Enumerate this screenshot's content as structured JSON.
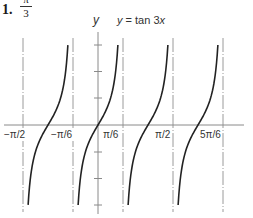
{
  "header": {
    "problem_number": "1.",
    "fraction_numerator": "π",
    "fraction_denominator": "3"
  },
  "chart_data": {
    "type": "line",
    "title": "y = tan 3x",
    "function": "tan(3x)",
    "xlabel": "",
    "ylabel": "y",
    "x_tick_labels": [
      "−π/2",
      "−π/6",
      "π/6",
      "π/2",
      "5π/6"
    ],
    "x_tick_values": [
      -1.5708,
      -0.5236,
      0.5236,
      1.5708,
      2.618
    ],
    "vertical_asymptotes": [
      "−π/2",
      "−π/6",
      "π/6",
      "π/2",
      "5π/6"
    ],
    "xlim": [
      -1.65,
      3.1
    ],
    "ylim": [
      -3.2,
      3.2
    ],
    "y_ticks": [
      -3,
      -2,
      -1,
      1,
      2,
      3
    ],
    "grid": false,
    "branches": [
      {
        "center": "−π/3",
        "x_range": [
          -1.4633,
          -0.6311
        ],
        "y_range": [
          -3,
          3
        ]
      },
      {
        "center": "0",
        "x_range": [
          -0.4163,
          0.4163
        ],
        "y_range": [
          -3,
          3
        ]
      },
      {
        "center": "π/3",
        "x_range": [
          0.6309,
          1.4635
        ],
        "y_range": [
          -3,
          3
        ]
      },
      {
        "center": "2π/3",
        "x_range": [
          1.6781,
          2.5107
        ],
        "y_range": [
          -3,
          3
        ]
      }
    ]
  },
  "colors": {
    "curve": "#222222",
    "axis": "#888888",
    "asymptote": "#999999",
    "text": "#333333"
  }
}
